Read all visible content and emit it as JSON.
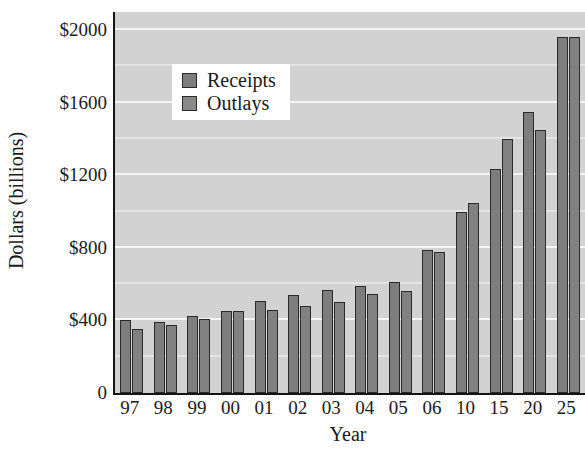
{
  "chart_data": {
    "type": "bar",
    "title": "",
    "xlabel": "Year",
    "ylabel": "Dollars (billions)",
    "categories": [
      "97",
      "98",
      "99",
      "00",
      "01",
      "02",
      "03",
      "04",
      "05",
      "06",
      "10",
      "15",
      "20",
      "25"
    ],
    "series": [
      {
        "name": "Receipts",
        "values": [
          400,
          390,
          425,
          450,
          505,
          540,
          570,
          590,
          610,
          790,
          1000,
          1235,
          1550,
          1960
        ]
      },
      {
        "name": "Outlays",
        "values": [
          355,
          375,
          410,
          450,
          460,
          480,
          500,
          545,
          565,
          775,
          1045,
          1400,
          1450,
          1960
        ]
      }
    ],
    "ylim": [
      0,
      2100
    ],
    "yticks": [
      0,
      400,
      800,
      1200,
      1600,
      2000
    ],
    "ytick_labels": [
      "0",
      "$400",
      "$800",
      "$1200",
      "$1600",
      "$2000"
    ],
    "y_minor_gridlines": [
      200,
      600,
      1000,
      1400,
      1800
    ],
    "grid": true,
    "legend_position": "upper-left-inside",
    "colors": {
      "receipts": "#7d7d7d",
      "outlays": "#818181",
      "plot_background": "#d2d2d2",
      "gridline": "#f4f4f4",
      "axis": "#141414"
    }
  },
  "legend": {
    "entries": [
      {
        "label": "Receipts"
      },
      {
        "label": "Outlays"
      }
    ]
  }
}
